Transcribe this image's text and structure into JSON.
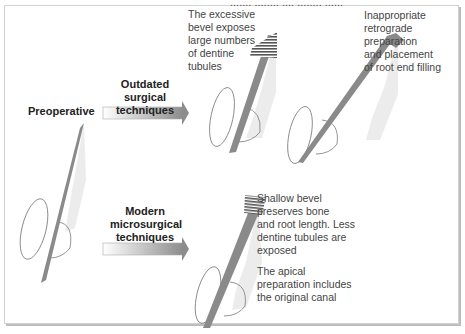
{
  "header": {
    "clipped_caption": "....... ........ .... ........ ......"
  },
  "stages": {
    "preoperative": "Preoperative",
    "outdated": "Outdated surgical techniques",
    "modern": "Modern microsurgical techniques"
  },
  "annotations": {
    "excessive_bevel": "The excessive bevel exposes large numbers of dentine tubules",
    "inappropriate_prep": "Inappropriate retrograde preparation and placement of root end filling",
    "shallow_bevel": "Shallow bevel preserves bone and root length. Less dentine tubules are exposed",
    "apical_prep": "The apical preparation includes the original canal"
  },
  "labels_lines": {
    "outdated": [
      "Outdated surgical",
      "techniques"
    ],
    "modern": [
      "Modern",
      "microsurgical",
      "techniques"
    ],
    "excessive_bevel": [
      "The excessive",
      "bevel exposes",
      "large numbers",
      "of dentine",
      "tubules"
    ],
    "inappropriate_prep": [
      "Inappropriate",
      "retrograde",
      "preparation",
      "and placement",
      "of root end filling"
    ],
    "shallow_bevel": [
      "Shallow bevel",
      "preserves bone",
      "and root length. Less",
      "dentine tubules are",
      "exposed"
    ],
    "apical_prep": [
      "The apical",
      "preparation includes",
      "the original canal"
    ]
  },
  "colors": {
    "root_fill": "#e8e8e8",
    "canal": "#8a8a8a",
    "outline": "#7a7a7a",
    "arrow_start": "#ffffff",
    "arrow_end": "#8c8c8c",
    "frame_border": "#d2d2d2"
  }
}
